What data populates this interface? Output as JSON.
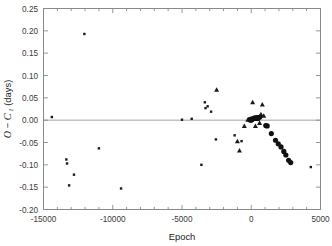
{
  "chart_data": {
    "type": "scatter",
    "title": "",
    "xlabel": "Epoch",
    "ylabel": "O − C 1 (days)",
    "ylabel_parts": {
      "o": "O",
      "minus": "−",
      "c": "C",
      "sub": "1",
      "units": "(days)"
    },
    "xlim": [
      -15000,
      5000
    ],
    "ylim": [
      -0.2,
      0.25
    ],
    "xticks": [
      -15000,
      -10000,
      -5000,
      0,
      5000
    ],
    "xticklabels": [
      "-15000",
      "-10000",
      "-5000",
      "0",
      "5000"
    ],
    "xminor_step": 1000,
    "yticks": [
      0.25,
      0.2,
      0.15,
      0.1,
      0.05,
      0.0,
      -0.05,
      -0.1,
      -0.15,
      -0.2
    ],
    "yticklabels": [
      "0.25",
      "0.20",
      "0.15",
      "0.10",
      "0.05",
      "0.00",
      "-0.05",
      "-0.10",
      "-0.15",
      "-0.20"
    ],
    "grid": false,
    "legend": "none",
    "reference_line": {
      "y": 0.0,
      "color": "#9a9a9a"
    },
    "marker_color": "#111111",
    "series": [
      {
        "name": "visual/photographic (small dots)",
        "marker": "small-dot",
        "points": [
          [
            -14400,
            0.007
          ],
          [
            -13350,
            -0.088
          ],
          [
            -13300,
            -0.097
          ],
          [
            -13150,
            -0.146
          ],
          [
            -12800,
            -0.122
          ],
          [
            -12050,
            0.193
          ],
          [
            -11000,
            -0.063
          ],
          [
            -9400,
            -0.153
          ],
          [
            -5000,
            0.001
          ],
          [
            -4300,
            0.003
          ],
          [
            -3600,
            -0.1
          ],
          [
            -3350,
            0.04
          ],
          [
            -3300,
            0.027
          ],
          [
            -3150,
            0.031
          ],
          [
            -2900,
            0.019
          ],
          [
            -2550,
            -0.043
          ],
          [
            -1200,
            -0.034
          ],
          [
            -700,
            -0.047
          ],
          [
            4300,
            -0.105
          ]
        ]
      },
      {
        "name": "photoelectric (triangles)",
        "marker": "triangle",
        "points": [
          [
            -2500,
            0.068
          ],
          [
            -1000,
            -0.047
          ],
          [
            -850,
            -0.068
          ],
          [
            -500,
            -0.013
          ],
          [
            -250,
            0.001
          ],
          [
            100,
            0.04
          ],
          [
            300,
            -0.013
          ],
          [
            450,
            0.003
          ],
          [
            700,
            0.013
          ],
          [
            800,
            0.035
          ],
          [
            900,
            0.01
          ],
          [
            600,
            -0.006
          ]
        ]
      },
      {
        "name": "CCD (large filled circles)",
        "marker": "large-circle",
        "points": [
          [
            -100,
            0.001
          ],
          [
            -60,
            0.002
          ],
          [
            -30,
            0.0
          ],
          [
            0,
            0.002
          ],
          [
            40,
            0.001
          ],
          [
            80,
            0.003
          ],
          [
            200,
            0.004
          ],
          [
            260,
            0.005
          ],
          [
            330,
            0.004
          ],
          [
            420,
            0.006
          ],
          [
            500,
            0.005
          ],
          [
            620,
            0.007
          ],
          [
            1050,
            -0.012
          ],
          [
            1150,
            -0.013
          ],
          [
            1450,
            -0.03
          ],
          [
            1750,
            -0.045
          ],
          [
            1950,
            -0.053
          ],
          [
            2150,
            -0.06
          ],
          [
            2350,
            -0.07
          ],
          [
            2500,
            -0.078
          ],
          [
            2700,
            -0.09
          ],
          [
            2850,
            -0.095
          ]
        ]
      }
    ]
  }
}
